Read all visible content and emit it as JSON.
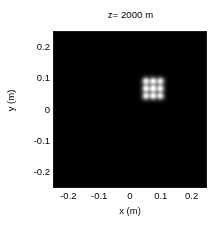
{
  "figure": {
    "background_color": "#ffffff",
    "axes_background_color": "#000000"
  },
  "title": "z= 2000 m",
  "axes": {
    "xlabel": "x (m)",
    "ylabel": "y (m)",
    "xticks": [
      "-0.2",
      "-0.1",
      "0",
      "0.1",
      "0.2"
    ],
    "yticks": [
      "0.2",
      "0.1",
      "0",
      "-0.1",
      "-0.2"
    ]
  },
  "chart_data": {
    "type": "heatmap",
    "title": "z= 2000 m",
    "xlabel": "x (m)",
    "ylabel": "y (m)",
    "xlim": [
      -0.25,
      0.25
    ],
    "ylim": [
      -0.25,
      0.25
    ],
    "xticks": [
      -0.2,
      -0.1,
      0,
      0.1,
      0.2
    ],
    "yticks": [
      -0.2,
      -0.1,
      0,
      0.1,
      0.2
    ],
    "xtick_labels": [
      "-0.2",
      "-0.1",
      "0",
      "0.1",
      "0.2"
    ],
    "ytick_labels": [
      "-0.2",
      "-0.1",
      "0",
      "0.1",
      "0.2"
    ],
    "grid": false,
    "legend": false,
    "colormap": "gray",
    "colormap_low": "#000000",
    "colormap_high": "#ffffff",
    "value_range": [
      0,
      1
    ],
    "pattern": {
      "kind": "grid-of-spots",
      "rows": 3,
      "cols": 3,
      "center_x": 0.072,
      "center_y": 0.07,
      "spot_pitch_x": 0.0235,
      "spot_pitch_y": 0.0235,
      "spot_sigma_x": 0.0082,
      "spot_sigma_y": 0.0082,
      "peak_intensity": 1.0
    },
    "spots": [
      {
        "x": 0.0485,
        "y": 0.0935,
        "intensity": 0.92
      },
      {
        "x": 0.072,
        "y": 0.0935,
        "intensity": 0.95
      },
      {
        "x": 0.0955,
        "y": 0.0935,
        "intensity": 0.9
      },
      {
        "x": 0.0485,
        "y": 0.07,
        "intensity": 0.96
      },
      {
        "x": 0.072,
        "y": 0.07,
        "intensity": 1.0
      },
      {
        "x": 0.0955,
        "y": 0.07,
        "intensity": 0.94
      },
      {
        "x": 0.0485,
        "y": 0.0465,
        "intensity": 0.91
      },
      {
        "x": 0.072,
        "y": 0.0465,
        "intensity": 0.95
      },
      {
        "x": 0.0955,
        "y": 0.0465,
        "intensity": 0.89
      }
    ]
  }
}
